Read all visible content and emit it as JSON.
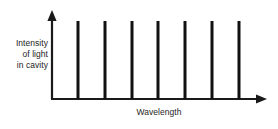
{
  "chart_data": {
    "type": "bar",
    "title": "",
    "subtitle": "",
    "xlabel": "Wavelength",
    "ylabel_lines": [
      "Intensity",
      "of light",
      "in cavity"
    ],
    "ylabel": "Intensity of light in cavity",
    "categories": [
      "1",
      "2",
      "3",
      "4",
      "5",
      "6",
      "7"
    ],
    "values": [
      1,
      1,
      1,
      1,
      1,
      1,
      1
    ],
    "x": [
      78,
      105,
      132,
      158,
      185,
      212,
      239
    ],
    "xlim": [
      52,
      266
    ],
    "ylim": [
      0,
      1.12
    ],
    "grid": false,
    "legend": null,
    "tick_labels_x": [],
    "tick_labels_y": [],
    "axis_arrows": true,
    "series": [
      {
        "name": "cavity modes",
        "values": [
          1,
          1,
          1,
          1,
          1,
          1,
          1
        ]
      }
    ],
    "annotations": [],
    "colors": {
      "spike": "#111111",
      "axis": "#1a1a1a",
      "text": "#1d1d1d",
      "background": "#ffffff"
    }
  }
}
